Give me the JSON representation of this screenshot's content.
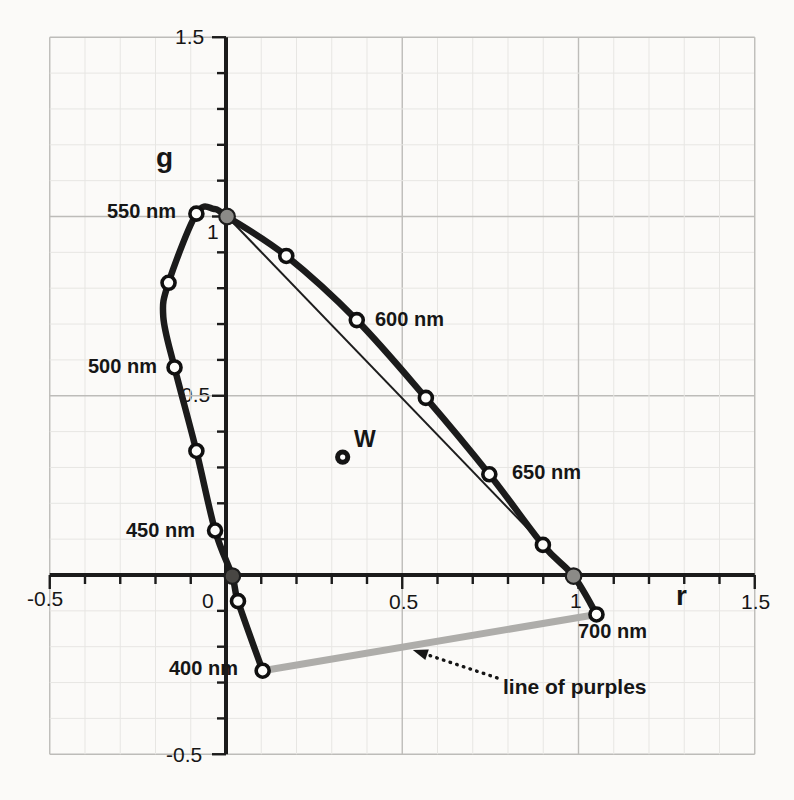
{
  "figure": {
    "background": "#fbfaf8"
  },
  "chart_data": {
    "type": "line",
    "xlabel": "r",
    "ylabel": "g",
    "xlim": [
      -0.5,
      1.5
    ],
    "ylim": [
      -0.5,
      1.5
    ],
    "grid": true,
    "grid_minor_step": 0.1,
    "grid_major_step": 0.5,
    "tick_minor_step": 0.1,
    "origin_label": "0",
    "x_ticks": {
      "labels": [
        {
          "value": -0.5,
          "text": "-0.5"
        },
        {
          "value": 0.5,
          "text": "0.5"
        },
        {
          "value": 1,
          "text": "1"
        },
        {
          "value": 1.5,
          "text": "1.5"
        }
      ]
    },
    "y_ticks": {
      "labels": [
        {
          "value": 1.5,
          "text": "1.5"
        },
        {
          "value": 1,
          "text": "1"
        },
        {
          "value": 0.5,
          "text": "0.5"
        },
        {
          "value": -0.5,
          "text": "-0.5"
        }
      ]
    },
    "spectral_locus": {
      "points": [
        {
          "nm": 400,
          "r": 0.104,
          "g": -0.267,
          "marker": "open",
          "label": "400 nm"
        },
        {
          "r": 0.034,
          "g": -0.073,
          "marker": "open"
        },
        {
          "r": 0.018,
          "g": -0.003,
          "marker": "dark"
        },
        {
          "nm": 450,
          "r": -0.031,
          "g": 0.124,
          "marker": "open",
          "label": "450 nm"
        },
        {
          "r": -0.084,
          "g": 0.346,
          "marker": "open"
        },
        {
          "nm": 500,
          "r": -0.146,
          "g": 0.579,
          "marker": "open",
          "label": "500 nm"
        },
        {
          "r": -0.178,
          "g": 0.72,
          "marker": "none"
        },
        {
          "r": -0.163,
          "g": 0.815,
          "marker": "open"
        },
        {
          "nm": 550,
          "r": -0.084,
          "g": 1.008,
          "marker": "open",
          "label": "550 nm"
        },
        {
          "r": -0.034,
          "g": 1.021,
          "marker": "none"
        },
        {
          "r": 0.003,
          "g": 1.0,
          "marker": "gray"
        },
        {
          "r": 0.171,
          "g": 0.89,
          "marker": "open"
        },
        {
          "nm": 600,
          "r": 0.371,
          "g": 0.711,
          "marker": "open",
          "label": "600 nm"
        },
        {
          "r": 0.567,
          "g": 0.494,
          "marker": "open"
        },
        {
          "nm": 650,
          "r": 0.747,
          "g": 0.281,
          "marker": "open",
          "label": "650 nm"
        },
        {
          "r": 0.899,
          "g": 0.084,
          "marker": "open"
        },
        {
          "r": 0.986,
          "g": -0.003,
          "marker": "gray"
        },
        {
          "nm": 700,
          "r": 1.051,
          "g": -0.11,
          "marker": "open",
          "label": "700 nm"
        }
      ]
    },
    "gamut_triangle_line": {
      "from": [
        0.003,
        1.0
      ],
      "to": [
        0.986,
        -0.003
      ]
    },
    "line_of_purples": {
      "from": [
        0.104,
        -0.267
      ],
      "to": [
        1.051,
        -0.11
      ]
    },
    "white_point": {
      "r": 0.331,
      "g": 0.329,
      "label": "W"
    },
    "annotation": {
      "label": "line of purples",
      "arrow_tail": [
        0.769,
        -0.287
      ],
      "arrow_tip": [
        0.53,
        -0.209
      ]
    },
    "colors": {
      "axis": "#1b1b1b",
      "curve": "#1b1b1b",
      "thin_line": "#1d1d1d",
      "grid_minor": "#e7e6e3",
      "grid_major": "#bdbcb9",
      "purple_line": "#aeadaa",
      "marker_open_fill": "#fdfdfb",
      "marker_gray_fill": "#8b8a87",
      "marker_dark_fill": "#484643",
      "white_point_fill": "#151515"
    }
  }
}
